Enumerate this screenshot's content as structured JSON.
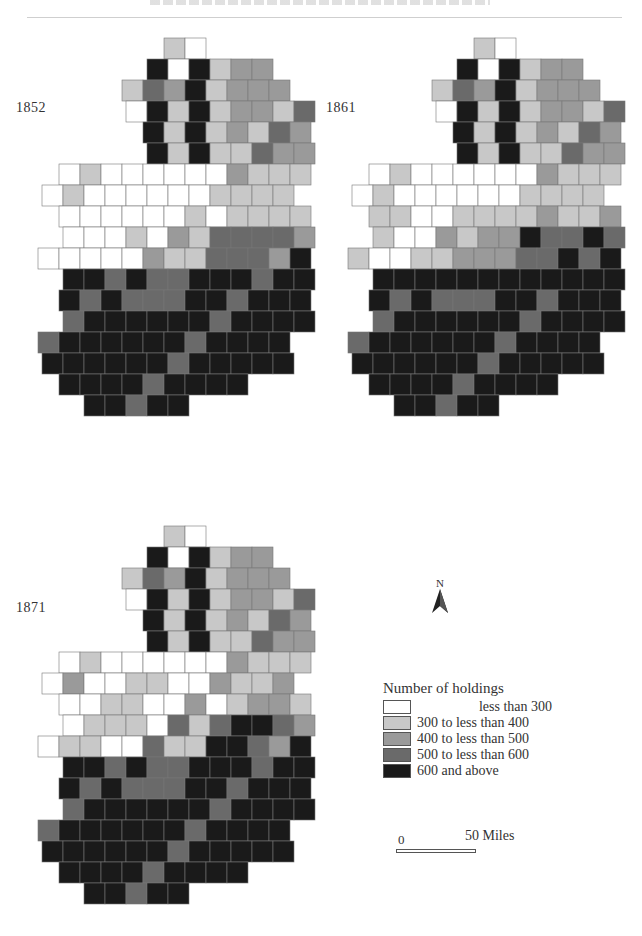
{
  "header": {
    "running_title_clipped": true
  },
  "maps": [
    {
      "year": "1852",
      "left": 28,
      "top": 30
    },
    {
      "year": "1861",
      "left": 338,
      "top": 30
    },
    {
      "year": "1871",
      "left": 28,
      "top": 518
    }
  ],
  "legend": {
    "title": "Number of holdings",
    "items": [
      {
        "label": "less than 300",
        "color": "#ffffff"
      },
      {
        "label": "300 to less than 400",
        "color": "#c8c8c8"
      },
      {
        "label": "400 to less than 500",
        "color": "#9a9a9a"
      },
      {
        "label": "500 to less than 600",
        "color": "#6a6a6a"
      },
      {
        "label": "600 and above",
        "color": "#1a1a1a"
      }
    ]
  },
  "north_arrow": {
    "label": "N",
    "icon": "north-arrow-icon"
  },
  "scale_bar": {
    "start_label": "0",
    "end_label": "50 Miles"
  },
  "chart_data": {
    "type": "heatmap",
    "panels": [
      "1852",
      "1861",
      "1871"
    ],
    "legend_classes": [
      "less than 300",
      "300 to less than 400",
      "400 to less than 500",
      "500 to less than 600",
      "600 and above"
    ]
  }
}
